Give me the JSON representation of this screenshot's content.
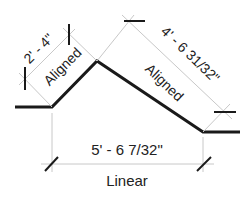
{
  "diagram": {
    "colors": {
      "geometry": "#1a1a1a",
      "extension": "#c8c8c8",
      "tick": "#1a1a1a",
      "text": "#222222"
    },
    "dimensions": [
      {
        "id": "left-aligned",
        "value": "2' - 4\"",
        "type_label": "Aligned"
      },
      {
        "id": "right-aligned",
        "value": "4' - 6 31/32\"",
        "type_label": "Aligned"
      },
      {
        "id": "bottom-linear",
        "value": "5' - 6 7/32\"",
        "type_label": "Linear"
      }
    ]
  }
}
